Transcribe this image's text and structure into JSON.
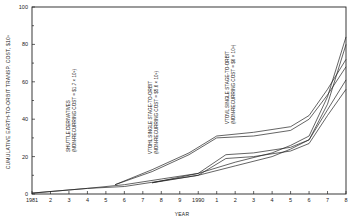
{
  "chart_data": {
    "type": "line",
    "title": "",
    "xlabel": "YEAR",
    "ylabel": "CUMULATIVE EARTH-TO-ORBIT TRANSP. COST, $10⁹",
    "xlim": [
      1981,
      1998
    ],
    "ylim": [
      0,
      100
    ],
    "x_tick_labels": [
      "1981",
      "2",
      "3",
      "4",
      "5",
      "6",
      "7",
      "8",
      "9",
      "1990",
      "1",
      "2",
      "3",
      "4",
      "5",
      "6",
      "7",
      "8"
    ],
    "y_tick_labels": [
      "0",
      "20",
      "40",
      "60",
      "80",
      "100"
    ],
    "grid": false,
    "legend": "none (inline annotations)",
    "annotations": [
      {
        "line1": "SHUTTLE DERIVATIVES",
        "line2": "(NON-RECURRING COST = $1.7 × 10⁹)"
      },
      {
        "line1": "VTOHL SINGLE STAGE-TO-ORBIT",
        "line2": "(NON-RECURRING COST = $5.6 × 10⁹)"
      },
      {
        "line1": "VTOVL SINGLE STAGE-TO-ORBIT",
        "line2": "(NON-RECURRING COST = $6 × 10⁹)"
      }
    ],
    "series": [
      {
        "name": "Shuttle derivatives (upper)",
        "x": [
          1981,
          1984,
          1986,
          1988,
          1990,
          1992,
          1994,
          1995,
          1996,
          1997,
          1998
        ],
        "values": [
          0.5,
          3,
          5,
          8,
          11,
          17,
          22,
          26,
          31,
          52,
          84
        ]
      },
      {
        "name": "Shuttle derivatives (lower)",
        "x": [
          1981,
          1984,
          1986,
          1988,
          1990,
          1992,
          1994,
          1995,
          1996,
          1997,
          1998
        ],
        "values": [
          0.5,
          3,
          4,
          7,
          10,
          15,
          20,
          24,
          29,
          48,
          80
        ]
      },
      {
        "name": "VTOHL SSTO (upper)",
        "x": [
          1985.5,
          1987.5,
          1989.5,
          1991,
          1993,
          1995,
          1996,
          1997,
          1998
        ],
        "values": [
          5,
          13,
          22,
          31,
          33,
          36,
          42,
          56,
          72
        ]
      },
      {
        "name": "VTOHL SSTO (lower)",
        "x": [
          1985.5,
          1987.5,
          1989.5,
          1991,
          1993,
          1995,
          1996,
          1997,
          1998
        ],
        "values": [
          5,
          12,
          21,
          30,
          31,
          34,
          40,
          53,
          68
        ]
      },
      {
        "name": "VTOVL SSTO (upper)",
        "x": [
          1987.5,
          1990,
          1991.5,
          1993,
          1995,
          1996,
          1997,
          1998
        ],
        "values": [
          6,
          11,
          21,
          22,
          25,
          29,
          45,
          61
        ]
      },
      {
        "name": "VTOVL SSTO (lower)",
        "x": [
          1987.5,
          1990,
          1991.5,
          1993,
          1995,
          1996,
          1997,
          1998
        ],
        "values": [
          6,
          10,
          19,
          20,
          23,
          27,
          42,
          56
        ]
      }
    ]
  }
}
